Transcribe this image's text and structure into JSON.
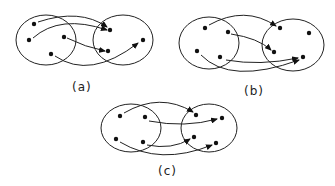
{
  "diagrams": [
    {
      "id": "a",
      "caption": "(a)"
    },
    {
      "id": "b",
      "caption": "(b)"
    },
    {
      "id": "c",
      "caption": "(c)"
    }
  ]
}
